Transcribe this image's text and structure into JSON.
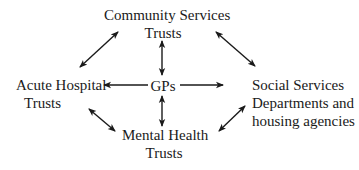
{
  "diagram": {
    "type": "network",
    "nodes": {
      "community": {
        "lines": [
          "Community Services",
          "Trusts"
        ]
      },
      "gps": {
        "lines": [
          "GPs"
        ]
      },
      "acute": {
        "lines": [
          "Acute Hospital",
          "Trusts"
        ]
      },
      "social": {
        "lines": [
          "Social Services",
          "Departments and",
          "housing agencies"
        ]
      },
      "mental": {
        "lines": [
          "Mental Health",
          "Trusts"
        ]
      }
    },
    "edges": [
      {
        "from": "GPs",
        "to": "Community Services Trusts",
        "direction": "both"
      },
      {
        "from": "GPs",
        "to": "Mental Health Trusts",
        "direction": "both"
      },
      {
        "from": "GPs",
        "to": "Acute Hospital Trusts",
        "direction": "forward"
      },
      {
        "from": "GPs",
        "to": "Social Services Departments and housing agencies",
        "direction": "forward"
      },
      {
        "from": "Community Services Trusts",
        "to": "Acute Hospital Trusts",
        "direction": "both"
      },
      {
        "from": "Community Services Trusts",
        "to": "Social Services Departments and housing agencies",
        "direction": "both"
      },
      {
        "from": "Acute Hospital Trusts",
        "to": "Mental Health Trusts",
        "direction": "both"
      },
      {
        "from": "Mental Health Trusts",
        "to": "Social Services Departments and housing agencies",
        "direction": "both"
      }
    ],
    "colors": {
      "text": "#1a1a1a",
      "arrow": "#1a1a1a",
      "background": "#ffffff"
    }
  }
}
